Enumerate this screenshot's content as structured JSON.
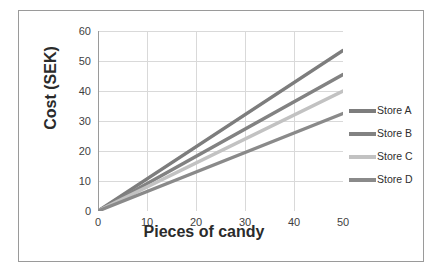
{
  "figure": {
    "border_color": "#9a9a9a",
    "background": "#ffffff"
  },
  "axes": {
    "x_title": "Pieces of candy",
    "y_title": "Cost (SEK)",
    "x_ticks": [
      "0",
      "10",
      "20",
      "30",
      "40",
      "50"
    ],
    "y_ticks": [
      "0",
      "10",
      "20",
      "30",
      "40",
      "50",
      "60"
    ],
    "gridline_color": "#d9d9d9",
    "axis_line_color": "#9a9a9a",
    "tick_label_color": "#3f3f3f"
  },
  "legend": {
    "position": "right",
    "entries": [
      {
        "label": "Store A",
        "color": "#7d7d7d"
      },
      {
        "label": "Store B",
        "color": "#828282"
      },
      {
        "label": "Store C",
        "color": "#c2c2c2"
      },
      {
        "label": "Store D",
        "color": "#8a8a8a"
      }
    ]
  },
  "chart_data": {
    "type": "line",
    "title": "",
    "subtitle": "",
    "xlabel": "Pieces of candy",
    "ylabel": "Cost (SEK)",
    "xlim": [
      0,
      50
    ],
    "ylim": [
      0,
      60
    ],
    "x_ticks": [
      0,
      10,
      20,
      30,
      40,
      50
    ],
    "y_ticks": [
      0,
      10,
      20,
      30,
      40,
      50,
      60
    ],
    "x_minor_tick_interval": 5,
    "grid": true,
    "grid_axis": "both",
    "legend_position": "right",
    "x": [
      0,
      50
    ],
    "series": [
      {
        "name": "Store A",
        "color": "#7d7d7d",
        "slope": 1.07,
        "intercept": 0,
        "values": [
          0,
          53.5
        ]
      },
      {
        "name": "Store B",
        "color": "#828282",
        "slope": 0.91,
        "intercept": 0,
        "values": [
          0,
          45.5
        ]
      },
      {
        "name": "Store C",
        "color": "#c2c2c2",
        "slope": 0.8,
        "intercept": 0,
        "values": [
          0,
          40.0
        ]
      },
      {
        "name": "Store D",
        "color": "#8a8a8a",
        "slope": 0.65,
        "intercept": 0,
        "values": [
          0,
          32.5
        ]
      }
    ]
  }
}
